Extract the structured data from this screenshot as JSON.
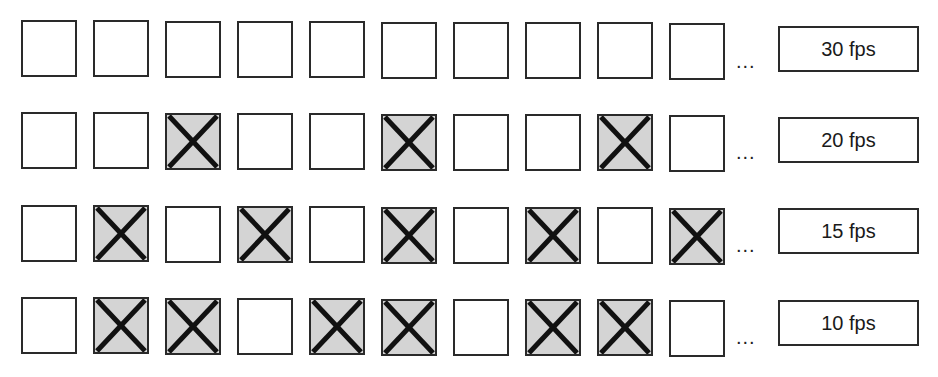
{
  "diagram": {
    "title": "",
    "frame_count_shown": 10,
    "ellipsis": "...",
    "colors": {
      "dropped_fill": "#d4d4d4",
      "outline": "#2a2a2a",
      "kept_fill": "#ffffff"
    },
    "rows": [
      {
        "label": "30 fps",
        "dropped": [
          false,
          false,
          false,
          false,
          false,
          false,
          false,
          false,
          false,
          false
        ]
      },
      {
        "label": "20 fps",
        "dropped": [
          false,
          false,
          true,
          false,
          false,
          true,
          false,
          false,
          true,
          false
        ]
      },
      {
        "label": "15 fps",
        "dropped": [
          false,
          true,
          false,
          true,
          false,
          true,
          false,
          true,
          false,
          true
        ]
      },
      {
        "label": "10 fps",
        "dropped": [
          false,
          true,
          true,
          false,
          true,
          true,
          false,
          true,
          true,
          false
        ]
      }
    ]
  }
}
